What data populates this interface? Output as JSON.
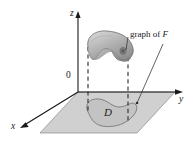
{
  "figure": {
    "background_color": "#ffffff",
    "stroke_color": "#1a1a1a",
    "axes": {
      "z_label": "z",
      "y_label": "y",
      "x_label": "x",
      "origin_label": "0"
    },
    "region": {
      "label": "D",
      "plane_fill": "#cfcfcf",
      "region_fill": "#c4c4c4"
    },
    "surface": {
      "caption_prefix": "graph of ",
      "caption_symbol": "F",
      "caption_full": "graph of F",
      "fill_light": "#d8d8d8",
      "fill_dark": "#8e8e8e"
    }
  }
}
